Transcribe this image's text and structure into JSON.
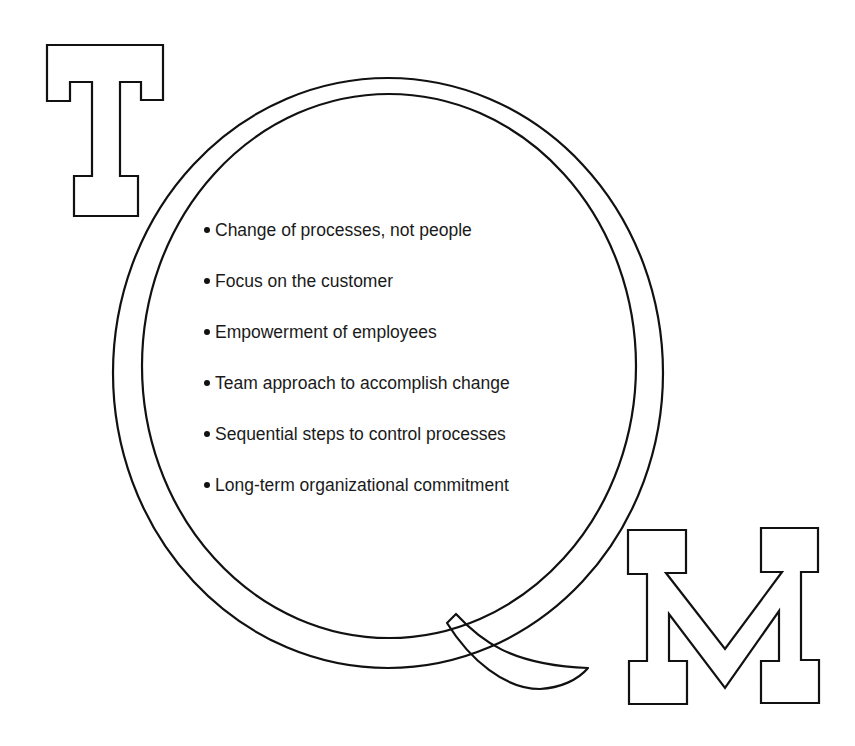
{
  "figure": {
    "title_letters": [
      "T",
      "Q",
      "M"
    ],
    "acronym": "TQM",
    "colors": {
      "ink": "#111111",
      "background": "#ffffff"
    },
    "principles": [
      {
        "label": "Change of processes, not people"
      },
      {
        "label": "Focus on the customer"
      },
      {
        "label": "Empowerment of employees"
      },
      {
        "label": "Team approach to accomplish change"
      },
      {
        "label": "Sequential steps to control processes"
      },
      {
        "label": "Long-term organizational commitment"
      }
    ]
  }
}
